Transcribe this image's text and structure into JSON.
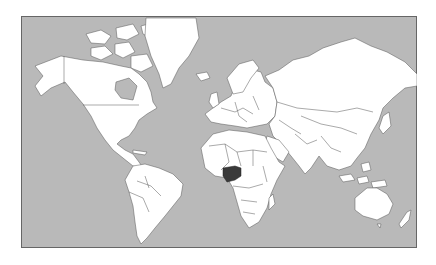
{
  "map": {
    "title": "World map",
    "projection": "Mercator",
    "highlighted_country": "Nigeria",
    "colors": {
      "ocean": "#b9b9b9",
      "land": "#ffffff",
      "border": "#555555",
      "highlight": "#3a3a3a",
      "frame": "#666666"
    }
  }
}
